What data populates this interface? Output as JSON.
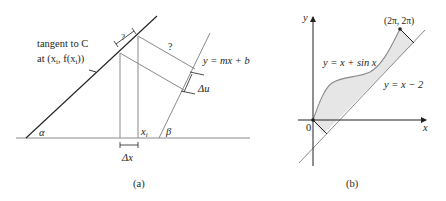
{
  "panel_a": {
    "caption": "(a)",
    "tangent_label_line1": "tangent to C",
    "tangent_label_line2": "at (x",
    "tangent_label_sub_i": "i",
    "tangent_label_mid": ", f(x",
    "tangent_label_sub_i2": "i",
    "tangent_label_end": "))",
    "line_label": "y = mx + b",
    "unknown_top": "?",
    "unknown_perp": "?",
    "delta_u": "Δu",
    "delta_x": "Δx",
    "x_i": "x",
    "x_i_sub": "i",
    "alpha": "α",
    "beta": "β"
  },
  "panel_b": {
    "caption": "(b)",
    "y_axis": "y",
    "x_axis": "x",
    "origin": "0",
    "endpoint": "(2π, 2π)",
    "curve_label": "y = x + sin x",
    "line_label": "y = x − 2",
    "fill_color": "#e6e6e6",
    "line_color": "#8a8a8a"
  }
}
